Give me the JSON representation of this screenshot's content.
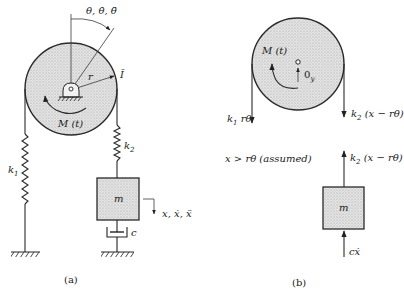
{
  "figure": {
    "panel_a": {
      "caption": "(a)",
      "angle_label": "θ, θ̇, θ̈",
      "radius_label": "r",
      "inertia_label": "Ī",
      "moment_label": "M (t)",
      "spring1_label": "k",
      "spring1_sub": "1",
      "spring2_label": "k",
      "spring2_sub": "2",
      "mass_label": "m",
      "damper_label": "c",
      "displacement_label": "x, ẋ, ẍ"
    },
    "panel_b": {
      "caption": "(b)",
      "moment_label": "M (t)",
      "reaction_label": "0",
      "reaction_sub": "y",
      "force_left_label": "k",
      "force_left_sub": "1",
      "force_left_tail": " rθ",
      "force_right_label": "k",
      "force_right_sub": "2",
      "force_right_tail": " (x − rθ)",
      "force_mass_top_label": "k",
      "force_mass_top_sub": "2",
      "force_mass_top_tail": " (x − rθ)",
      "assumption": "x > rθ (assumed)",
      "mass_label": "m",
      "damping_force_label": "cẋ"
    }
  }
}
